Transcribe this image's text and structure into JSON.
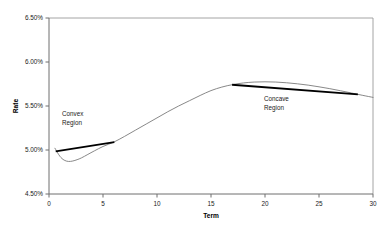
{
  "chart_data": {
    "type": "line",
    "title": "",
    "xlabel": "Term",
    "ylabel": "Rate",
    "xlim": [
      0,
      30
    ],
    "ylim": [
      4.5,
      6.5
    ],
    "grid": false,
    "legend": "none",
    "x_ticks": [
      "0",
      "5",
      "10",
      "15",
      "20",
      "25",
      "30"
    ],
    "x_tick_values": [
      0,
      5,
      10,
      15,
      20,
      25,
      30
    ],
    "y_ticks": [
      "4.50%",
      "5.00%",
      "5.50%",
      "6.00%",
      "6.50%"
    ],
    "y_tick_values": [
      4.5,
      5.0,
      5.5,
      6.0,
      6.5
    ],
    "series": [
      {
        "name": "yield-curve",
        "x": [
          0.55,
          1.0,
          1.4,
          1.8,
          2.2,
          2.6,
          3.0,
          3.6,
          4.2,
          5.0,
          6.0,
          7.0,
          8.0,
          9.0,
          10.0,
          11.0,
          12.0,
          13.0,
          14.0,
          15.0,
          16.0,
          17.0,
          18.0,
          19.0,
          20.0,
          21.0,
          22.0,
          23.0,
          24.0,
          25.0,
          26.0,
          27.0,
          28.0,
          29.0,
          30.0
        ],
        "values": [
          5.02,
          4.93,
          4.885,
          4.87,
          4.875,
          4.89,
          4.91,
          4.95,
          4.99,
          5.04,
          5.09,
          5.155,
          5.225,
          5.295,
          5.365,
          5.435,
          5.5,
          5.56,
          5.62,
          5.675,
          5.715,
          5.743,
          5.762,
          5.772,
          5.775,
          5.772,
          5.764,
          5.752,
          5.737,
          5.718,
          5.697,
          5.673,
          5.648,
          5.622,
          5.598
        ]
      }
    ],
    "annotations": [
      {
        "label": "Convex Region",
        "line1": "Convex",
        "line2": "Region",
        "region": "convex",
        "chord": {
          "x0": 0.62,
          "y0": 4.985,
          "x1": 6.05,
          "y1": 5.09
        },
        "note": "chord lies above the curve"
      },
      {
        "label": "Concave Region",
        "line1": "Concave",
        "line2": "Region",
        "region": "concave",
        "chord": {
          "x0": 16.95,
          "y0": 5.742,
          "x1": 28.6,
          "y1": 5.632
        },
        "note": "chord lies below the curve"
      }
    ],
    "colors": {
      "curve": "#7a7a7a",
      "chord": "#000000",
      "axis": "#6e6e6e",
      "frame": "#9a9a9a",
      "text": "#1a1a1a",
      "background": "#ffffff"
    }
  }
}
